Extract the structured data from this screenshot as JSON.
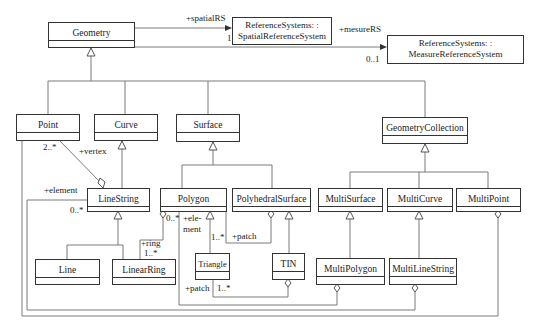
{
  "diagram": {
    "type": "UML class diagram",
    "classes": {
      "geometry": "Geometry",
      "point": "Point",
      "curve": "Curve",
      "surface": "Surface",
      "geometry_collection": "GeometryCollection",
      "line_string": "LineString",
      "polygon": "Polygon",
      "polyhedral_surface": "PolyhedralSurface",
      "multi_surface": "MultiSurface",
      "multi_curve": "MultiCurve",
      "multi_point": "MultiPoint",
      "line": "Line",
      "linear_ring": "LinearRing",
      "triangle": "Triangle",
      "tin": "TIN",
      "multi_polygon": "MultiPolygon",
      "multi_line_string": "MultiLineString"
    },
    "reference_systems": {
      "spatial": {
        "line1": "ReferenceSystems: :",
        "line2": "SpatialReferenceSystem"
      },
      "measure": {
        "line1": "ReferenceSystems: :",
        "line2": "MeasureReferenceSystem"
      }
    },
    "labels": {
      "spatial_rs_role": "+spatialRS",
      "spatial_rs_mult": "1",
      "measure_rs_role": "+mesureRS",
      "measure_rs_mult": "0..1",
      "vertex_mult": "2..*",
      "vertex_role": "+vertex",
      "element_role_linestring": "+element",
      "element_mult_linestring": "0..*",
      "polygon_ring_mult": "0..*",
      "element_role_polygon_1": "+ele-",
      "element_role_polygon_2": "ment",
      "ring_role": "+ring",
      "ring_mult": "1..*",
      "triangle_mult": "1..*",
      "patch_role_polyhedral": "+patch",
      "patch_role_tin": "+patch",
      "patch_mult_tin": "1..*"
    },
    "colors": {
      "line": "#333333",
      "connector": "#777777",
      "background": "#ffffff"
    }
  }
}
